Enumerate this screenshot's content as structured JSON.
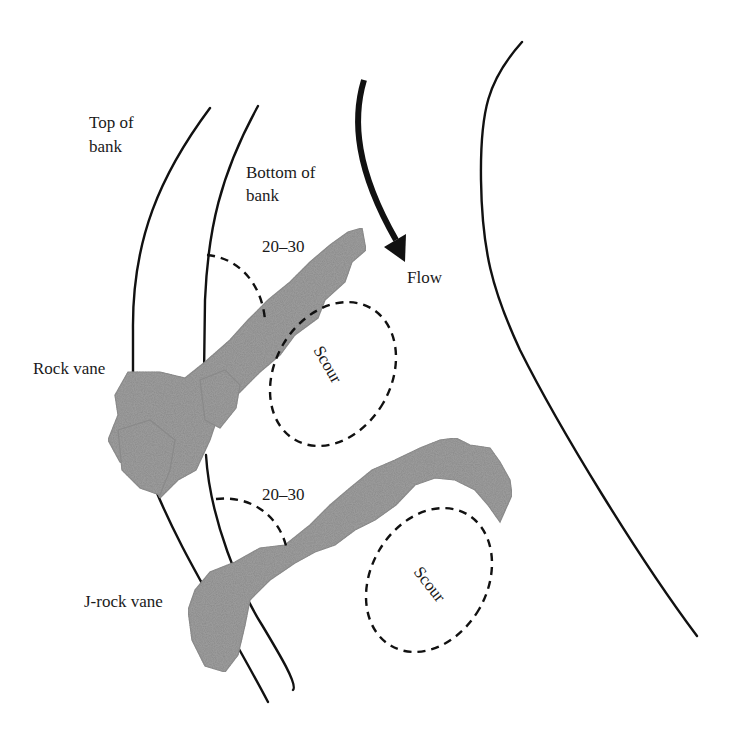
{
  "figure": {
    "type": "plan-view schematic of streambank rock vanes",
    "labels": {
      "top_of_bank": [
        "Top of",
        "bank"
      ],
      "bottom_of_bank": [
        "Bottom of",
        "bank"
      ],
      "angle_upper": "20–30",
      "angle_lower": "20–30",
      "flow": "Flow",
      "rock_vane": "Rock vane",
      "j_rock_vane": "J-rock vane",
      "scour_upper": "Scour",
      "scour_lower": "Scour"
    },
    "colors": {
      "line": "#111111",
      "rock": "#9a9a9a",
      "background": "#ffffff"
    }
  }
}
